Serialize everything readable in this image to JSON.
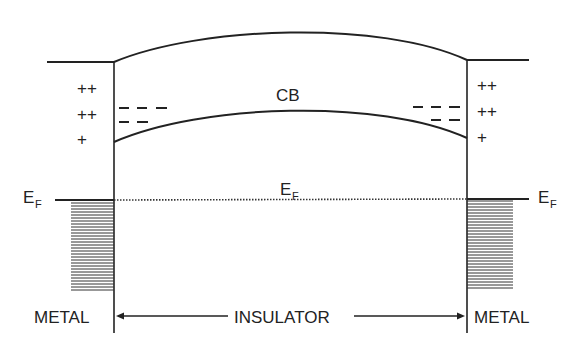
{
  "diagram": {
    "labels": {
      "conduction_band": "CB",
      "fermi_level_main": "E",
      "fermi_level_sub": "F",
      "left_region": "METAL",
      "center_region": "INSULATOR",
      "right_region": "METAL"
    },
    "left_charges": [
      "++",
      "++",
      "+"
    ],
    "right_charges": [
      "++",
      "++",
      "+"
    ],
    "left_negative_charges": [
      "– – –",
      "– –"
    ],
    "right_negative_charges": [
      "– – –",
      "– –"
    ],
    "colors": {
      "line": "#222222",
      "background": "#ffffff"
    }
  }
}
